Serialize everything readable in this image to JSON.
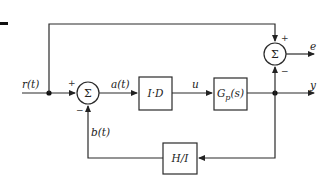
{
  "diagram": {
    "type": "block-diagram",
    "signals": {
      "input": "r(t)",
      "error_inner": "a(t)",
      "control": "u",
      "feedback": "b(t)",
      "output_y": "y",
      "output_e": "e"
    },
    "blocks": {
      "controller": "I·D",
      "plant_main": "G",
      "plant_sub": "p",
      "plant_arg": "(s)",
      "feedback": "H/I"
    },
    "summers": {
      "symbol": "Σ",
      "inner_plus": "+",
      "inner_minus": "−",
      "outer_plus": "+",
      "outer_minus": "−"
    }
  }
}
